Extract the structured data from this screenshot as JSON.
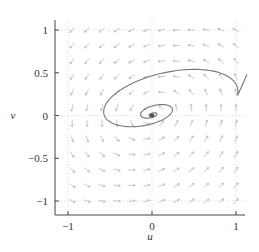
{
  "chart_data": {
    "type": "quiver",
    "title": "",
    "xlabel": "u",
    "ylabel": "v",
    "xlim": [
      -1.15,
      1.15
    ],
    "ylim": [
      -1.15,
      1.15
    ],
    "x_ticks": [
      -1,
      0,
      1
    ],
    "x_tick_labels": [
      "−1",
      "0",
      "1"
    ],
    "y_ticks": [
      -1,
      -0.5,
      0,
      0.5,
      1
    ],
    "y_tick_labels": [
      "−1",
      "−0.5",
      "0",
      "0.5",
      "1"
    ],
    "grid": "dotted at u=−1,0,1 and v=−1,0,1",
    "vector_field": {
      "grid_u_range": [
        -0.95,
        1.0
      ],
      "grid_v_range": [
        -1.0,
        1.0
      ],
      "description": "light gray arrows; pointing left near top, right near bottom, rotating around origin"
    },
    "trajectory": {
      "description": "spiral converging to origin, starting at right edge near (1.1, 0.45)",
      "color": "#777777"
    },
    "fixed_point": {
      "u": 0,
      "v": 0,
      "color": "#555555"
    }
  },
  "axes": {
    "x_label": "u",
    "y_label": "v"
  }
}
